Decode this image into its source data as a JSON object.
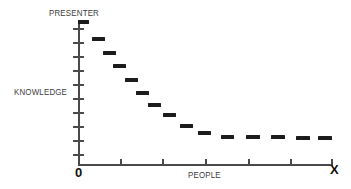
{
  "chart_data": {
    "type": "scatter",
    "title": "",
    "subtitle": "",
    "xlabel": "PEOPLE",
    "ylabel": "KNOWLEDGE",
    "x_axis_origin_label": "0",
    "x_axis_end_label": "X",
    "y_axis_top_label": "PRESENTER",
    "grid": false,
    "legend": null,
    "marker_style": "horizontal-dash",
    "xlim": [
      0,
      14
    ],
    "ylim": [
      0,
      10
    ],
    "x_tick_count": 6,
    "y_tick_count": 10,
    "x": [
      0,
      1,
      2,
      3,
      4,
      5,
      6,
      7,
      8,
      9,
      10,
      11,
      12,
      13,
      14
    ],
    "values": [
      10.0,
      8.6,
      7.3,
      6.2,
      5.1,
      4.2,
      3.5,
      2.9,
      2.4,
      2.0,
      1.75,
      1.6,
      1.5,
      1.45,
      1.4
    ],
    "points": [
      {
        "x": 78,
        "y": 20,
        "w": 11
      },
      {
        "x": 92,
        "y": 37,
        "w": 13
      },
      {
        "x": 103,
        "y": 51,
        "w": 13
      },
      {
        "x": 113,
        "y": 64,
        "w": 13
      },
      {
        "x": 125,
        "y": 78,
        "w": 13
      },
      {
        "x": 136,
        "y": 91,
        "w": 13
      },
      {
        "x": 148,
        "y": 103,
        "w": 13
      },
      {
        "x": 163,
        "y": 113,
        "w": 13
      },
      {
        "x": 180,
        "y": 124,
        "w": 13
      },
      {
        "x": 198,
        "y": 131,
        "w": 13
      },
      {
        "x": 221,
        "y": 135,
        "w": 13
      },
      {
        "x": 246,
        "y": 135,
        "w": 14
      },
      {
        "x": 271,
        "y": 135,
        "w": 14
      },
      {
        "x": 296,
        "y": 136,
        "w": 14
      },
      {
        "x": 318,
        "y": 136,
        "w": 14
      }
    ]
  },
  "axes": {
    "y_ticks": [
      28,
      42,
      56,
      70,
      84,
      98,
      112,
      126,
      140,
      154
    ],
    "x_ticks": [
      120,
      162,
      205,
      248,
      290,
      331
    ]
  },
  "colors": {
    "ink": "#1c1c1c",
    "axis": "#4a4a4a",
    "label": "#3d3d3d",
    "background": "#ffffff"
  }
}
